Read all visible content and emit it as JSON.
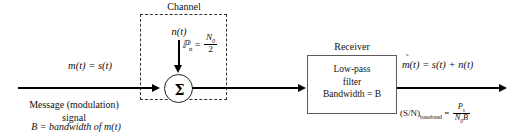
{
  "diagram": {
    "background_color": "#ffffff",
    "line_color": "#000000",
    "box_border_color": "#5a5a5a",
    "dashed_border_color": "#333333"
  },
  "channel": {
    "title": "Channel",
    "noise_signal_label": "n(t)",
    "noise_power_symbol": "ℙ",
    "noise_power_subscript": "n",
    "noise_power_equals": "=",
    "noise_power_numerator": "N",
    "noise_power_numerator_sub": "0",
    "noise_power_denominator": "2",
    "sum_symbol": "Σ"
  },
  "input": {
    "signal_label": "m(t) = s(t)",
    "caption_line1": "Message (modulation)",
    "caption_line2": "signal",
    "bandwidth_caption": "B = bandwidth of m(t)"
  },
  "receiver": {
    "title": "Receiver",
    "block_line1": "Low-pass",
    "block_line2": "filter",
    "block_line3": "Bandwidth = B"
  },
  "output": {
    "signal_label_m": "m",
    "tilde": "̃",
    "signal_label_rest": "(t) = s(t) + n(t)",
    "snr_label": "(S/N)",
    "snr_subscript": "baseband",
    "snr_equals": "=",
    "snr_numerator": "P",
    "snr_numerator_sub": "s",
    "snr_denominator_n": "N",
    "snr_denominator_n_sub": "0",
    "snr_denominator_b": "B"
  }
}
